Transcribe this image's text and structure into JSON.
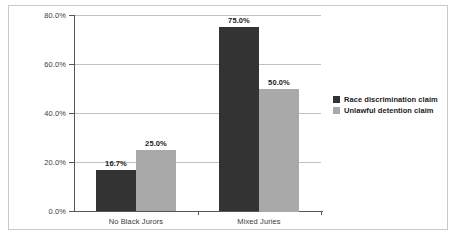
{
  "chart_data": {
    "type": "bar",
    "title": "",
    "xlabel": "",
    "ylabel": "",
    "categories": [
      "No Black Jurors",
      "Mixed Juries"
    ],
    "series": [
      {
        "name": "Race discrimination claim",
        "color": "#333333",
        "values": [
          16.7,
          75.0
        ],
        "labels": [
          "16.7%",
          "75.0%"
        ]
      },
      {
        "name": "Unlawful detention claim",
        "color": "#a9a9a9",
        "values": [
          25.0,
          50.0
        ],
        "labels": [
          "25.0%",
          "50.0%"
        ]
      }
    ],
    "ylim": [
      0,
      80
    ],
    "y_ticks": [
      0,
      20,
      40,
      60,
      80
    ],
    "y_tick_labels": [
      "0.0%",
      "20.0%",
      "40.0%",
      "60.0%",
      "80.0%"
    ],
    "grid": true,
    "legend_position": "right"
  }
}
